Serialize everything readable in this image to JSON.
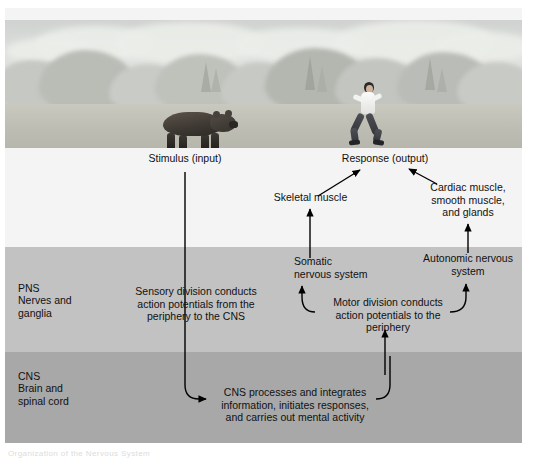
{
  "figure": {
    "title": "Organization of the Nervous System",
    "photo": {
      "scene": "forest-scene",
      "stimulus_subject": "bear",
      "response_subject": "running-person"
    },
    "zones": [
      {
        "id": "top",
        "label": "",
        "sublabel": "",
        "color": "#f4f4f4"
      },
      {
        "id": "pns",
        "label": "PNS",
        "sublabel": "Nerves and\nganglia",
        "color": "#c2c2c2"
      },
      {
        "id": "cns",
        "label": "CNS",
        "sublabel": "Brain and\nspinal cord",
        "color": "#a8a8a8"
      }
    ],
    "labels": {
      "stimulus": "Stimulus (input)",
      "response": "Response (output)",
      "skeletal_muscle": "Skeletal muscle",
      "cardiac_group": "Cardiac muscle,\nsmooth muscle,\nand glands",
      "somatic": "Somatic\nnervous system",
      "autonomic": "Autonomic nervous\nsystem",
      "sensory_division": "Sensory division conducts\naction potentials from the\nperiphery to the CNS",
      "motor_division": "Motor division conducts\naction potentials to the\nperiphery",
      "cns_process": "CNS processes and integrates\ninformation, initiates responses,\nand carries out mental activity",
      "pns_zone": "PNS",
      "pns_zone_sub": "Nerves and\nganglia",
      "cns_zone": "CNS",
      "cns_zone_sub": "Brain and\nspinal cord"
    },
    "colors": {
      "ink": "#000000",
      "zone_top": "#f4f4f4",
      "zone_pns": "#c2c2c2",
      "zone_cns": "#a8a8a8",
      "text": "#111111"
    },
    "flow": [
      {
        "from": "Stimulus (input)",
        "to": "CNS processes and integrates information, initiates responses, and carries out mental activity",
        "via": "Sensory division conducts action potentials from the periphery to the CNS"
      },
      {
        "from": "CNS processes and integrates information, initiates responses, and carries out mental activity",
        "to": "Motor division conducts action potentials to the periphery"
      },
      {
        "from": "Motor division conducts action potentials to the periphery",
        "to": "Somatic nervous system"
      },
      {
        "from": "Motor division conducts action potentials to the periphery",
        "to": "Autonomic nervous system"
      },
      {
        "from": "Somatic nervous system",
        "to": "Skeletal muscle"
      },
      {
        "from": "Autonomic nervous system",
        "to": "Cardiac muscle, smooth muscle, and glands"
      },
      {
        "from": "Skeletal muscle",
        "to": "Response (output)"
      },
      {
        "from": "Cardiac muscle, smooth muscle, and glands",
        "to": "Response (output)"
      }
    ]
  }
}
